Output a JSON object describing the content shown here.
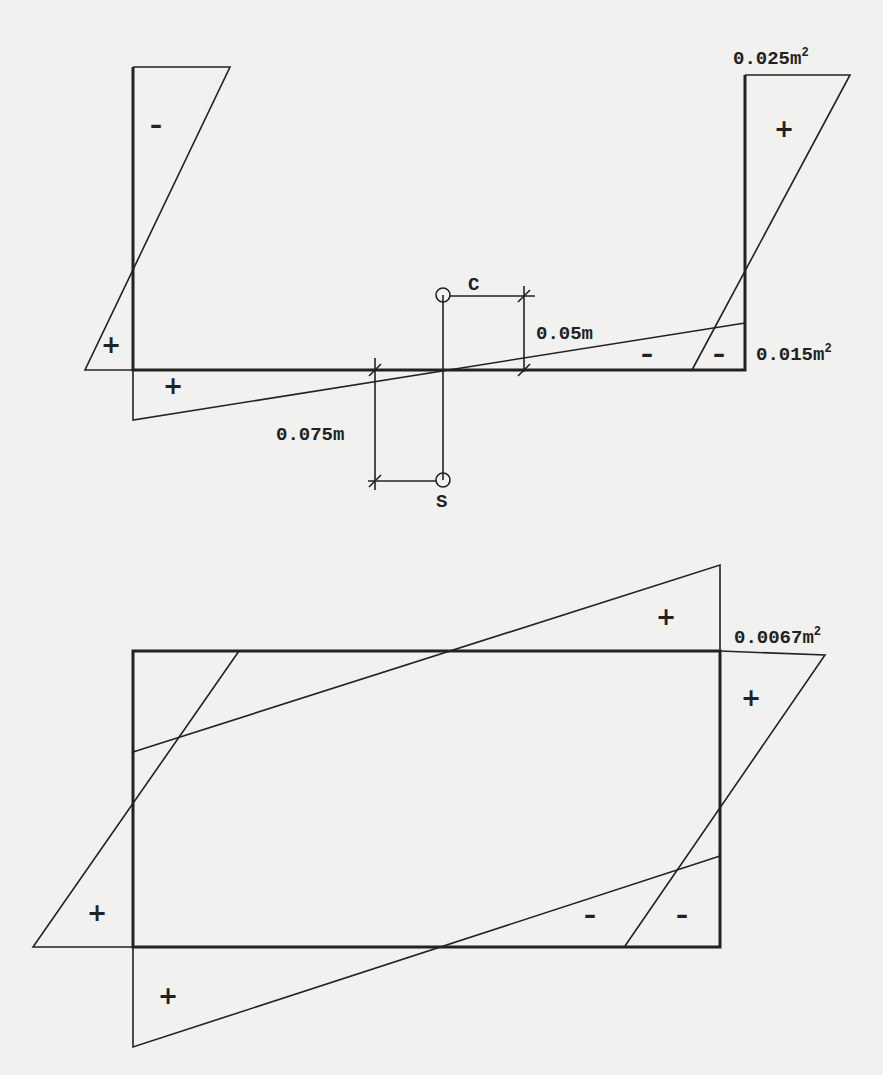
{
  "figure_top": {
    "labels": {
      "flange_right_area": "0.025m",
      "web_area": "0.015m",
      "centroid_offset": "0.05m",
      "shear_center_offset": "0.075m",
      "centroid_point": "C",
      "shear_center_point": "S",
      "superscript": "2"
    },
    "signs": {
      "left_top": "–",
      "left_bottom": "+",
      "web_left": "+",
      "right_top": "+",
      "web_right_a": "–",
      "web_right_b": "–"
    }
  },
  "figure_bottom": {
    "labels": {
      "area": "0.0067m",
      "superscript": "2"
    },
    "signs": {
      "top_right": "+",
      "right_flange": "+",
      "left_flange": "+",
      "bottom_left": "+",
      "bottom_mid": "–",
      "bottom_right": "–"
    }
  },
  "colors": {
    "paper": "#f1f1ef",
    "ink": "#222222"
  }
}
